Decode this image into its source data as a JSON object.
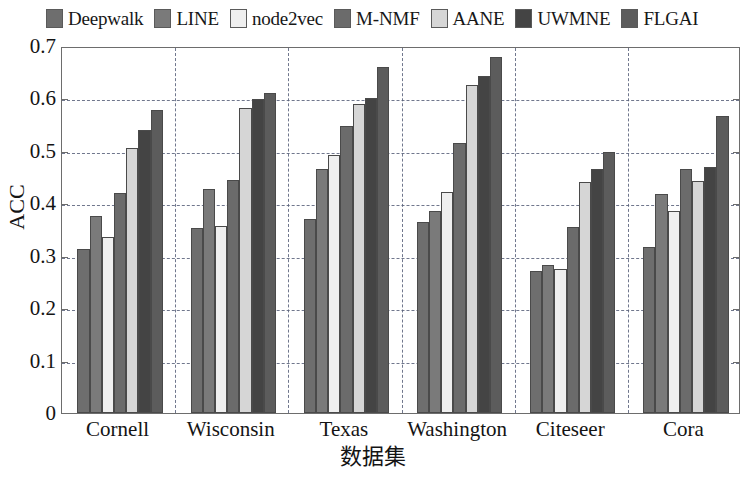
{
  "chart_data": {
    "type": "bar",
    "title": "",
    "xlabel": "数据集",
    "ylabel": "ACC",
    "categories": [
      "Cornell",
      "Wisconsin",
      "Texas",
      "Washington",
      "Citeseer",
      "Cora"
    ],
    "ylim": [
      0,
      0.7
    ],
    "ytick_labels": [
      "0",
      "0.1",
      "0.2",
      "0.3",
      "0.4",
      "0.5",
      "0.6",
      "0.7"
    ],
    "ytick_values": [
      0,
      0.1,
      0.2,
      0.3,
      0.4,
      0.5,
      0.6,
      0.7
    ],
    "grid": "horizontal-and-vertical-dashed",
    "legend_position": "above-plot",
    "series": [
      {
        "name": "Deepwalk",
        "color": "#6e6e6e",
        "values": [
          0.313,
          0.353,
          0.37,
          0.365,
          0.27,
          0.317
        ]
      },
      {
        "name": "LINE",
        "color": "#7a7a7a",
        "values": [
          0.375,
          0.427,
          0.466,
          0.385,
          0.283,
          0.417
        ]
      },
      {
        "name": "node2vec",
        "color": "#efefef",
        "values": [
          0.335,
          0.357,
          0.492,
          0.422,
          0.275,
          0.385
        ]
      },
      {
        "name": "M-NMF",
        "color": "#6b6b6b",
        "values": [
          0.42,
          0.445,
          0.548,
          0.515,
          0.355,
          0.465
        ]
      },
      {
        "name": "AANE",
        "color": "#d6d6d6",
        "values": [
          0.505,
          0.582,
          0.59,
          0.625,
          0.44,
          0.443
        ]
      },
      {
        "name": "UWMNE",
        "color": "#444444",
        "values": [
          0.54,
          0.598,
          0.6,
          0.643,
          0.465,
          0.47
        ]
      },
      {
        "name": "FLGAI",
        "color": "#5c5c5c",
        "values": [
          0.578,
          0.61,
          0.66,
          0.68,
          0.497,
          0.567
        ]
      }
    ]
  }
}
